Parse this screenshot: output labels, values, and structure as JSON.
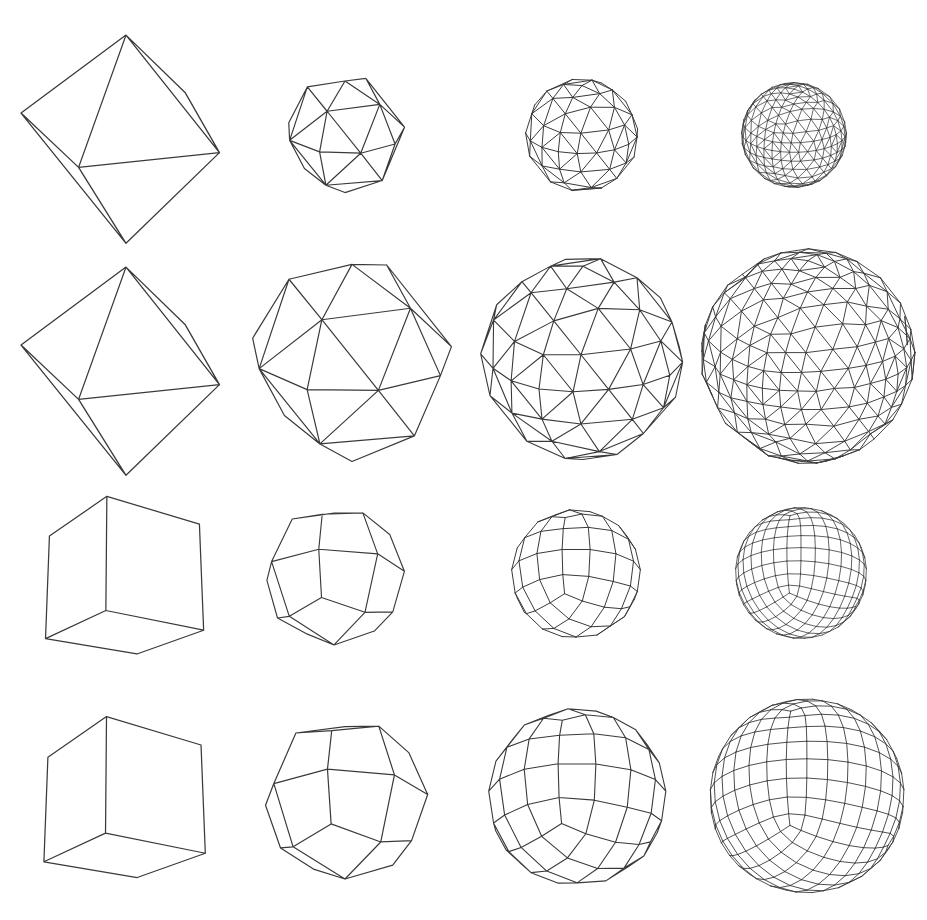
{
  "figure": {
    "width": 927,
    "height": 920,
    "background_color": "#ffffff",
    "line_color": "#3a3a3a",
    "rows": 4,
    "columns": 4
  },
  "grid": {
    "row_labels": [
      "octahedron-spherized-sequence",
      "octahedron-subdivision-sequence",
      "cube-spherized-sequence",
      "cube-subdivision-sequence"
    ],
    "column_labels": [
      "level-0-base-mesh",
      "level-1-subdivision",
      "level-2-subdivision",
      "level-3-subdivision"
    ]
  },
  "cells": [
    {
      "name": "octahedron-level-0",
      "row": 0,
      "col": 0,
      "base_solid": "octahedron",
      "mesh_type": "triangle",
      "subdivision_level": 0,
      "sphere_blend": 1.0,
      "x": 8,
      "y": 16,
      "width": 236,
      "height": 236,
      "radius": 112,
      "stroke_width": 1.3
    },
    {
      "name": "octahedron-level-1-sphere",
      "row": 0,
      "col": 1,
      "base_solid": "octahedron",
      "mesh_type": "triangle",
      "subdivision_level": 1,
      "sphere_blend": 1.0,
      "x": 275,
      "y": 72,
      "width": 140,
      "height": 124,
      "radius": 60,
      "stroke_width": 1.2
    },
    {
      "name": "octahedron-level-2-sphere",
      "row": 0,
      "col": 2,
      "base_solid": "octahedron",
      "mesh_type": "triangle",
      "subdivision_level": 2,
      "sphere_blend": 1.0,
      "x": 520,
      "y": 76,
      "width": 124,
      "height": 118,
      "radius": 56,
      "stroke_width": 1.0
    },
    {
      "name": "octahedron-level-3-sphere",
      "row": 0,
      "col": 3,
      "base_solid": "octahedron",
      "mesh_type": "triangle",
      "subdivision_level": 3,
      "sphere_blend": 1.0,
      "x": 738,
      "y": 80,
      "width": 112,
      "height": 110,
      "radius": 52,
      "stroke_width": 0.75
    },
    {
      "name": "octahedron-level-0-angular",
      "row": 1,
      "col": 0,
      "base_solid": "octahedron",
      "mesh_type": "triangle",
      "subdivision_level": 0,
      "sphere_blend": 1.0,
      "x": 8,
      "y": 248,
      "width": 236,
      "height": 236,
      "radius": 112,
      "stroke_width": 1.3
    },
    {
      "name": "octahedron-level-1-angular",
      "row": 1,
      "col": 1,
      "base_solid": "octahedron",
      "mesh_type": "triangle",
      "subdivision_level": 1,
      "sphere_blend": 0.82,
      "x": 238,
      "y": 248,
      "width": 228,
      "height": 220,
      "radius": 106,
      "stroke_width": 1.2
    },
    {
      "name": "octahedron-level-2-angular",
      "row": 1,
      "col": 2,
      "base_solid": "octahedron",
      "mesh_type": "triangle",
      "subdivision_level": 2,
      "sphere_blend": 0.78,
      "x": 470,
      "y": 250,
      "width": 226,
      "height": 216,
      "radius": 104,
      "stroke_width": 1.1
    },
    {
      "name": "octahedron-level-3-angular",
      "row": 1,
      "col": 3,
      "base_solid": "octahedron",
      "mesh_type": "triangle",
      "subdivision_level": 3,
      "sphere_blend": 0.76,
      "x": 692,
      "y": 242,
      "width": 232,
      "height": 228,
      "radius": 108,
      "stroke_width": 0.95
    },
    {
      "name": "cube-level-0",
      "row": 2,
      "col": 0,
      "base_solid": "cube",
      "mesh_type": "quad",
      "subdivision_level": 0,
      "sphere_blend": 0.0,
      "x": 16,
      "y": 490,
      "width": 214,
      "height": 182,
      "radius": 96,
      "stroke_width": 1.25
    },
    {
      "name": "cube-level-1-sphere",
      "row": 2,
      "col": 1,
      "base_solid": "cube",
      "mesh_type": "quad",
      "subdivision_level": 1,
      "sphere_blend": 1.0,
      "x": 258,
      "y": 500,
      "width": 152,
      "height": 152,
      "radius": 70,
      "stroke_width": 1.15
    },
    {
      "name": "cube-level-2-sphere",
      "row": 2,
      "col": 2,
      "base_solid": "cube",
      "mesh_type": "quad",
      "subdivision_level": 2,
      "sphere_blend": 1.0,
      "x": 506,
      "y": 504,
      "width": 140,
      "height": 140,
      "radius": 64,
      "stroke_width": 1.0
    },
    {
      "name": "cube-level-3-sphere",
      "row": 2,
      "col": 3,
      "base_solid": "cube",
      "mesh_type": "quad",
      "subdivision_level": 3,
      "sphere_blend": 1.0,
      "x": 730,
      "y": 502,
      "width": 142,
      "height": 142,
      "radius": 65,
      "stroke_width": 0.8
    },
    {
      "name": "cube-level-0-angular",
      "row": 3,
      "col": 0,
      "base_solid": "cube",
      "mesh_type": "quad",
      "subdivision_level": 0,
      "sphere_blend": 0.0,
      "x": 16,
      "y": 710,
      "width": 214,
      "height": 186,
      "radius": 98,
      "stroke_width": 1.25
    },
    {
      "name": "cube-level-1-angular",
      "row": 3,
      "col": 1,
      "base_solid": "cube",
      "mesh_type": "quad",
      "subdivision_level": 1,
      "sphere_blend": 0.55,
      "x": 238,
      "y": 700,
      "width": 214,
      "height": 200,
      "radius": 100,
      "stroke_width": 1.2
    },
    {
      "name": "cube-level-2-angular",
      "row": 3,
      "col": 2,
      "base_solid": "cube",
      "mesh_type": "quad",
      "subdivision_level": 2,
      "sphere_blend": 0.52,
      "x": 466,
      "y": 694,
      "width": 222,
      "height": 206,
      "radius": 103,
      "stroke_width": 1.1
    },
    {
      "name": "cube-level-3-angular",
      "row": 3,
      "col": 3,
      "base_solid": "cube",
      "mesh_type": "quad",
      "subdivision_level": 3,
      "sphere_blend": 0.5,
      "x": 694,
      "y": 690,
      "width": 226,
      "height": 212,
      "radius": 106,
      "stroke_width": 0.9
    }
  ],
  "view": {
    "octahedron_rotation_x_deg": -22,
    "octahedron_rotation_y_deg": 28,
    "cube_rotation_x_deg": -20,
    "cube_rotation_y_deg": 34,
    "perspective_distance": 7.5,
    "backface_culling": true
  }
}
